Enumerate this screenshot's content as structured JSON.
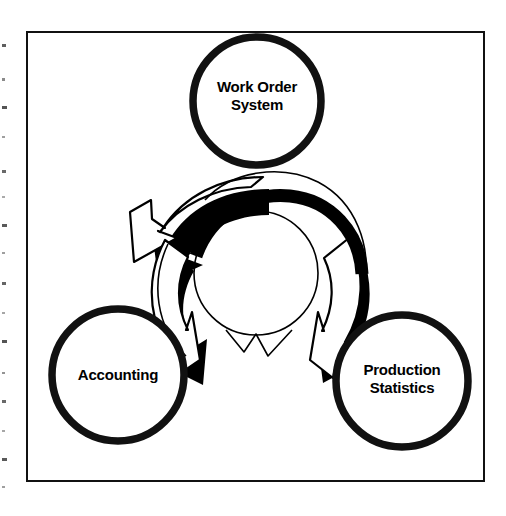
{
  "figure": {
    "type": "cycle-diagram",
    "title": "",
    "frame": {
      "shape": "rectangle",
      "border_color": "#111111"
    },
    "background_color": "#ffffff",
    "ink_color": "#000000"
  },
  "nodes": [
    {
      "id": "work-order-system",
      "shape": "circle",
      "position": "top",
      "label_lines": [
        "Work Order",
        "System"
      ],
      "label_line1": "Work Order",
      "label_line2": "System",
      "center_x": 257,
      "center_y": 101,
      "radius": 67
    },
    {
      "id": "accounting",
      "shape": "circle",
      "position": "bottom-left",
      "label_lines": [
        "Accounting"
      ],
      "label_line1": "Accounting",
      "label_line2": "",
      "center_x": 118,
      "center_y": 375,
      "radius": 69
    },
    {
      "id": "production-statistics",
      "shape": "circle",
      "position": "bottom-right",
      "label_lines": [
        "Production",
        "Statistics"
      ],
      "label_line1": "Production",
      "label_line2": "Statistics",
      "center_x": 402,
      "center_y": 381,
      "radius": 69
    }
  ],
  "cycle": {
    "description": "three curved arrows forming a continuous counterclockwise loop",
    "arrow_count": 3,
    "direction": "counterclockwise",
    "style": "white fill, black outline, heavy black offset shadow",
    "center_x": 256,
    "center_y": 273,
    "outer_radius": 98,
    "inner_radius": 60,
    "arrows": [
      {
        "id": "arrow-top-to-left",
        "from": "work-order-system",
        "to": "accounting"
      },
      {
        "id": "arrow-left-to-bottom",
        "from": "accounting",
        "to": "production-statistics"
      },
      {
        "id": "arrow-right-to-top",
        "from": "production-statistics",
        "to": "work-order-system"
      }
    ]
  },
  "scan_artifacts": {
    "present": true,
    "edge": "left",
    "marks": [
      44,
      78,
      106,
      136,
      170,
      196,
      224,
      252,
      282,
      312,
      340,
      372,
      400,
      430,
      458,
      486
    ]
  }
}
